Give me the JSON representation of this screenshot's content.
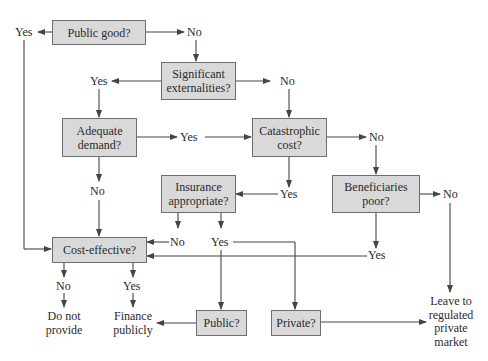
{
  "diagram": {
    "type": "decision-flowchart",
    "colors": {
      "box_fill": "#d9d9d9",
      "box_border": "#6e6e6e",
      "line": "#444444",
      "text": "#2a2a2a"
    },
    "decisions": {
      "public_good": "Public good?",
      "significant_externalities": "Significant externalities?",
      "adequate_demand": "Adequate demand?",
      "catastrophic_cost": "Catastrophic cost?",
      "insurance_appropriate": "Insurance appropriate?",
      "beneficiaries_poor": "Beneficiaries poor?",
      "cost_effective": "Cost-effective?",
      "public": "Public?",
      "private": "Private?"
    },
    "labels": {
      "public_good_yes": "Yes",
      "public_good_no": "No",
      "externalities_yes": "Yes",
      "externalities_no": "No",
      "demand_yes": "Yes",
      "demand_no": "No",
      "catastrophic_no": "No",
      "catastrophic_yes": "Yes",
      "beneficiaries_no": "No",
      "beneficiaries_yes": "Yes",
      "insurance_no": "No",
      "insurance_yes": "Yes",
      "cost_no": "No",
      "cost_yes": "Yes"
    },
    "outcomes": {
      "do_not_provide": "Do not provide",
      "finance_publicly": "Finance publicly",
      "leave_to_market": "Leave to regulated private market"
    },
    "edges": [
      {
        "from": "Public good?",
        "label": "Yes",
        "to": "Cost-effective?"
      },
      {
        "from": "Public good?",
        "label": "No",
        "to": "Significant externalities?"
      },
      {
        "from": "Significant externalities?",
        "label": "Yes",
        "to": "Adequate demand?"
      },
      {
        "from": "Significant externalities?",
        "label": "No",
        "to": "Catastrophic cost?"
      },
      {
        "from": "Adequate demand?",
        "label": "Yes",
        "to": "Catastrophic cost?"
      },
      {
        "from": "Adequate demand?",
        "label": "No",
        "to": "Cost-effective?"
      },
      {
        "from": "Catastrophic cost?",
        "label": "Yes",
        "to": "Insurance appropriate?"
      },
      {
        "from": "Catastrophic cost?",
        "label": "No",
        "to": "Beneficiaries poor?"
      },
      {
        "from": "Insurance appropriate?",
        "label": "No",
        "to": "Cost-effective?"
      },
      {
        "from": "Insurance appropriate?",
        "label": "Yes",
        "to": "Public?"
      },
      {
        "from": "Insurance appropriate?",
        "label": "Yes",
        "to": "Private?"
      },
      {
        "from": "Beneficiaries poor?",
        "label": "Yes",
        "to": "Cost-effective?"
      },
      {
        "from": "Beneficiaries poor?",
        "label": "No",
        "to": "Leave to regulated private market"
      },
      {
        "from": "Cost-effective?",
        "label": "No",
        "to": "Do not provide"
      },
      {
        "from": "Cost-effective?",
        "label": "Yes",
        "to": "Finance publicly"
      },
      {
        "from": "Public?",
        "label": "",
        "to": "Finance publicly"
      },
      {
        "from": "Private?",
        "label": "",
        "to": "Leave to regulated private market"
      }
    ]
  }
}
